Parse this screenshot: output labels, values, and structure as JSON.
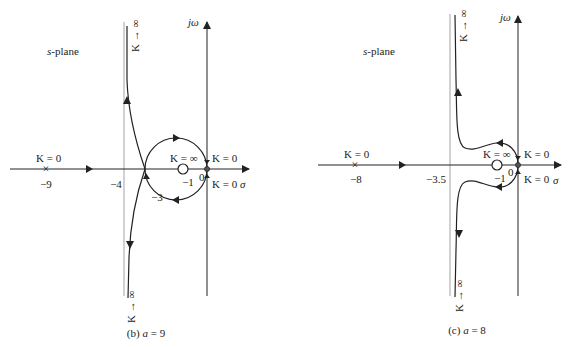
{
  "figures": [
    {
      "id": "b",
      "caption": "(b) a = 9",
      "caption_prefix": "(b) ",
      "caption_var": "a",
      "caption_value": " = 9",
      "plane_label_var": "s",
      "plane_label_rest": "-plane",
      "imag_axis_label": "jω",
      "real_axis_label": "σ",
      "asymptote_label": "−4",
      "pole_far_label": "K = 0",
      "pole_far_value": "−9",
      "zero_label": "K = ∞",
      "zero_value": "−1",
      "origin_value": "0",
      "origin_upper_label": "K = 0",
      "origin_lower_label": "K = 0",
      "breakaway_value": "−3",
      "upper_branch_label": "K → ∞",
      "lower_branch_label": "K → ∞"
    },
    {
      "id": "c",
      "caption": "(c) a = 8",
      "caption_prefix": "(c) ",
      "caption_var": "a",
      "caption_value": " = 8",
      "plane_label_var": "s",
      "plane_label_rest": "-plane",
      "imag_axis_label": "jω",
      "real_axis_label": "σ",
      "asymptote_label": "−3.5",
      "pole_far_label": "K = 0",
      "pole_far_value": "−8",
      "zero_label": "K = ∞",
      "zero_value": "−1",
      "origin_value": "0",
      "origin_upper_label": "K = 0",
      "origin_lower_label": "K = 0",
      "upper_branch_label": "K → ∞",
      "lower_branch_label": "K → ∞"
    }
  ],
  "colors": {
    "line": "#222222",
    "asymptote": "#888888"
  }
}
